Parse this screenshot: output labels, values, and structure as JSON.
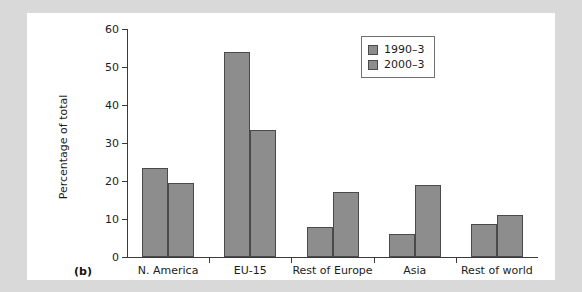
{
  "figure": {
    "panel_label": "(b)",
    "background_color": "#d9d9d9",
    "plate_color": "#ffffff"
  },
  "chart_data": {
    "type": "bar",
    "title": "",
    "subtitle": "",
    "xlabel": "",
    "ylabel": "Percentage of total",
    "categories": [
      "N. America",
      "EU-15",
      "Rest of Europe",
      "Asia",
      "Rest of world"
    ],
    "series": [
      {
        "name": "1990–3",
        "color": "#8d8d8d",
        "values": [
          23.4,
          54.0,
          8.0,
          6.0,
          8.7
        ]
      },
      {
        "name": "2000–3",
        "color": "#8d8d8d",
        "values": [
          19.5,
          33.4,
          17.0,
          19.0,
          11.0
        ]
      }
    ],
    "ylim": [
      0,
      60
    ],
    "yticks": [
      0,
      10,
      20,
      30,
      40,
      50,
      60
    ],
    "ytick_labels": [
      "0",
      "10",
      "20",
      "30",
      "40",
      "50",
      "60"
    ],
    "grid": false,
    "legend_position": "upper-right",
    "bar_fill_color": "#8d8d8d",
    "bar_border_color": "#4a4a4a",
    "axis_color": "#3a3a3a"
  }
}
